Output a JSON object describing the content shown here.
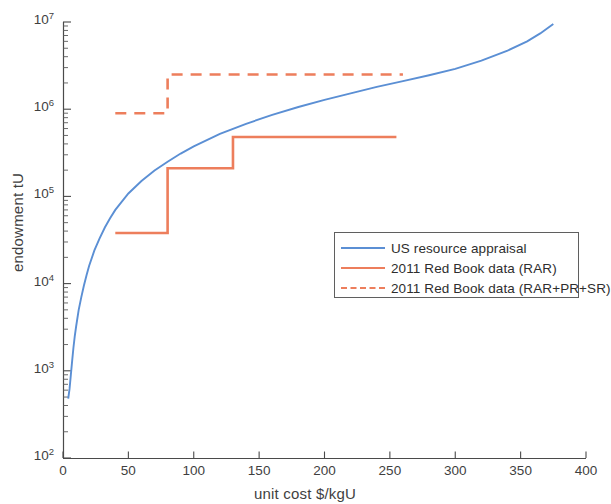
{
  "chart_data": {
    "type": "line",
    "title": "",
    "xlabel": "unit cost $/kgU",
    "ylabel": "endowment tU",
    "xlim": [
      0,
      400
    ],
    "ylim": [
      100,
      10000000
    ],
    "yscale": "log",
    "xscale": "linear",
    "grid": false,
    "legend_position": "center-right",
    "xticks": [
      "0",
      "50",
      "100",
      "150",
      "200",
      "250",
      "300",
      "350",
      "400"
    ],
    "xtick_values": [
      0,
      50,
      100,
      150,
      200,
      250,
      300,
      350,
      400
    ],
    "yticks": [
      "10^2",
      "10^3",
      "10^4",
      "10^5",
      "10^6",
      "10^7"
    ],
    "ytick_values": [
      100,
      1000,
      10000,
      100000,
      1000000,
      10000000
    ],
    "ytick_labels": [
      {
        "base": "10",
        "exp": "2"
      },
      {
        "base": "10",
        "exp": "3"
      },
      {
        "base": "10",
        "exp": "4"
      },
      {
        "base": "10",
        "exp": "5"
      },
      {
        "base": "10",
        "exp": "6"
      },
      {
        "base": "10",
        "exp": "7"
      }
    ],
    "series": [
      {
        "name": "US resource appraisal",
        "style": "solid",
        "color": "#5B8FD4",
        "type": "curve",
        "points": [
          [
            4,
            480
          ],
          [
            5,
            620
          ],
          [
            6,
            900
          ],
          [
            7,
            1300
          ],
          [
            8,
            1850
          ],
          [
            9,
            2500
          ],
          [
            10,
            3200
          ],
          [
            12,
            5000
          ],
          [
            14,
            7000
          ],
          [
            16,
            9500
          ],
          [
            18,
            12500
          ],
          [
            20,
            16000
          ],
          [
            24,
            24000
          ],
          [
            28,
            33000
          ],
          [
            32,
            44000
          ],
          [
            36,
            56000
          ],
          [
            40,
            70000
          ],
          [
            50,
            108000
          ],
          [
            60,
            150000
          ],
          [
            70,
            198000
          ],
          [
            80,
            250000
          ],
          [
            90,
            310000
          ],
          [
            100,
            375000
          ],
          [
            120,
            520000
          ],
          [
            140,
            680000
          ],
          [
            160,
            860000
          ],
          [
            180,
            1060000
          ],
          [
            200,
            1280000
          ],
          [
            220,
            1520000
          ],
          [
            240,
            1800000
          ],
          [
            260,
            2100000
          ],
          [
            280,
            2450000
          ],
          [
            300,
            2900000
          ],
          [
            320,
            3600000
          ],
          [
            340,
            4700000
          ],
          [
            355,
            6000000
          ],
          [
            365,
            7400000
          ],
          [
            375,
            9500000
          ]
        ]
      },
      {
        "name": "2011 Red Book data (RAR)",
        "style": "solid",
        "color": "#ED7E5C",
        "type": "step",
        "steps": [
          {
            "x_start": 40,
            "x_end": 80,
            "y": 38000
          },
          {
            "x_start": 80,
            "x_end": 130,
            "y": 210000
          },
          {
            "x_start": 130,
            "x_end": 255,
            "y": 480000
          }
        ]
      },
      {
        "name": "2011 Red Book data (RAR+PR+SR)",
        "style": "dashed",
        "color": "#ED7E5C",
        "type": "step",
        "steps": [
          {
            "x_start": 40,
            "x_end": 80,
            "y": 900000
          },
          {
            "x_start": 80,
            "x_end": 260,
            "y": 2500000
          }
        ]
      }
    ]
  },
  "legend": {
    "items": [
      {
        "label": "US resource appraisal",
        "color": "#5B8FD4",
        "style": "solid"
      },
      {
        "label": "2011 Red Book data (RAR)",
        "color": "#ED7E5C",
        "style": "solid"
      },
      {
        "label": "2011 Red Book data (RAR+PR+SR)",
        "color": "#ED7E5C",
        "style": "dashed"
      }
    ]
  }
}
